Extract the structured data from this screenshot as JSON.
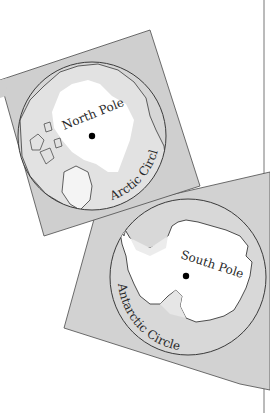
{
  "figure": {
    "north_map": {
      "pole_label": "North Pole",
      "circle_label": "Arctic Circle"
    },
    "south_map": {
      "pole_label": "South Pole",
      "circle_label": "Antarctic Circle"
    }
  },
  "colors": {
    "panel": "#cfcfcf",
    "land_light": "#e4e4e4",
    "ice": "#ffffff",
    "line": "#3a3a3a",
    "page_rule": "#777777"
  }
}
